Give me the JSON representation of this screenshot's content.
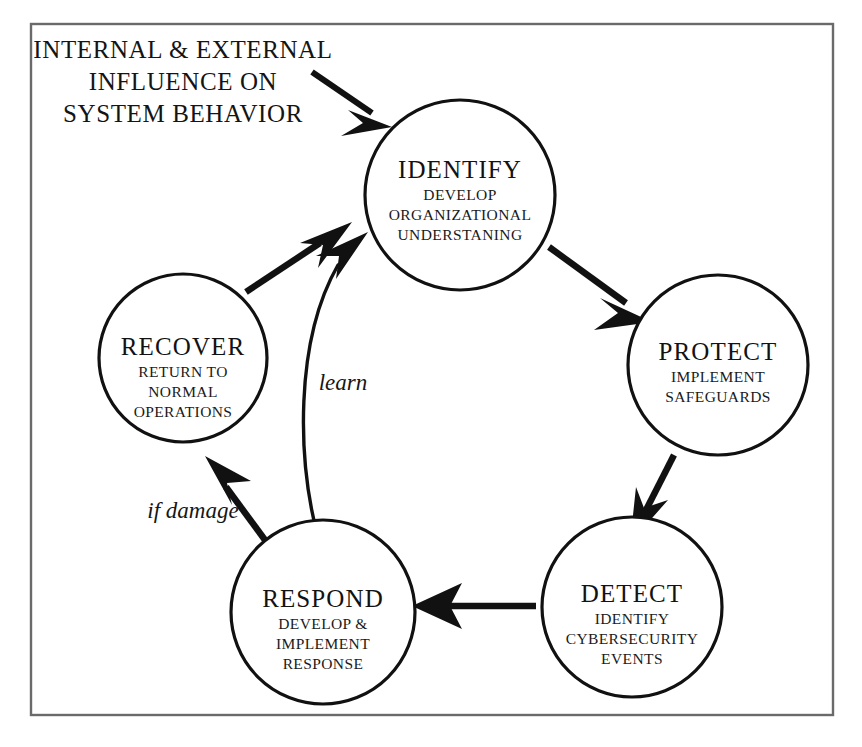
{
  "header": {
    "line1": "INTERNAL & EXTERNAL",
    "line2": "INFLUENCE ON",
    "line3": "SYSTEM BEHAVIOR"
  },
  "colors": {
    "stroke": "#111111",
    "frame": "#6a6a6a",
    "background": "#ffffff",
    "text": "#121212"
  },
  "nodes": [
    {
      "id": "identify",
      "title": "IDENTIFY",
      "sub": [
        "DEVELOP",
        "ORGANIZATIONAL",
        "UNDERSTANING"
      ]
    },
    {
      "id": "protect",
      "title": "PROTECT",
      "sub": [
        "IMPLEMENT",
        "SAFEGUARDS"
      ]
    },
    {
      "id": "detect",
      "title": "DETECT",
      "sub": [
        "IDENTIFY",
        "CYBERSECURITY",
        "EVENTS"
      ]
    },
    {
      "id": "respond",
      "title": "RESPOND",
      "sub": [
        "DEVELOP &",
        "IMPLEMENT",
        "RESPONSE"
      ]
    },
    {
      "id": "recover",
      "title": "RECOVER",
      "sub": [
        "RETURN TO",
        "NORMAL",
        "OPERATIONS"
      ]
    }
  ],
  "edges": {
    "learn_label": "learn",
    "if_damage_label": "if damage"
  }
}
